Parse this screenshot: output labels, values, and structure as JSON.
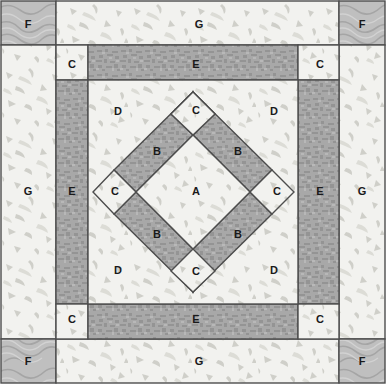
{
  "block": {
    "title": "Quilt Block Piecing Diagram",
    "width": 386,
    "height": 384,
    "outline_color": "#4d4d4d"
  },
  "fabrics": {
    "light_speckle": {
      "name": "light-speckled-fabric",
      "base_color": "#f2f2ef",
      "fleck_color": "#c9c9c4"
    },
    "dark_texture": {
      "name": "dark-textured-fabric",
      "base_color": "#a6a6a6",
      "fleck_color": "#8a8a8a"
    },
    "medium_swirl": {
      "name": "medium-swirl-fabric",
      "base_color": "#bdbdbd",
      "fleck_color": "#9e9e9e"
    }
  },
  "pieces": [
    {
      "id": "F-top-left",
      "label": "F",
      "fabric": "medium_swirl",
      "lx": 28,
      "ly": 27
    },
    {
      "id": "F-top-right",
      "label": "F",
      "fabric": "medium_swirl",
      "lx": 363,
      "ly": 27
    },
    {
      "id": "F-bottom-left",
      "label": "F",
      "fabric": "medium_swirl",
      "lx": 28,
      "ly": 364
    },
    {
      "id": "F-bottom-right",
      "label": "F",
      "fabric": "medium_swirl",
      "lx": 363,
      "ly": 364
    },
    {
      "id": "G-top",
      "label": "G",
      "fabric": "light_speckle",
      "lx": 199,
      "ly": 27
    },
    {
      "id": "G-bottom",
      "label": "G",
      "fabric": "light_speckle",
      "lx": 199,
      "ly": 364
    },
    {
      "id": "G-left",
      "label": "G",
      "fabric": "light_speckle",
      "lx": 28,
      "ly": 192
    },
    {
      "id": "G-right",
      "label": "G",
      "fabric": "light_speckle",
      "lx": 363,
      "ly": 192
    },
    {
      "id": "C-inner-top-left",
      "label": "C",
      "fabric": "light_speckle",
      "lx": 72,
      "ly": 67
    },
    {
      "id": "C-inner-top-right",
      "label": "C",
      "fabric": "light_speckle",
      "lx": 322,
      "ly": 67
    },
    {
      "id": "C-inner-bottom-left",
      "label": "C",
      "fabric": "light_speckle",
      "lx": 72,
      "ly": 320
    },
    {
      "id": "C-inner-bottom-right",
      "label": "C",
      "fabric": "light_speckle",
      "lx": 322,
      "ly": 320
    },
    {
      "id": "E-top",
      "label": "E",
      "fabric": "dark_texture",
      "lx": 196,
      "ly": 67
    },
    {
      "id": "E-bottom",
      "label": "E",
      "fabric": "dark_texture",
      "lx": 196,
      "ly": 320
    },
    {
      "id": "E-left",
      "label": "E",
      "fabric": "dark_texture",
      "lx": 72,
      "ly": 192
    },
    {
      "id": "E-right",
      "label": "E",
      "fabric": "dark_texture",
      "lx": 322,
      "ly": 192
    },
    {
      "id": "D-top-left",
      "label": "D",
      "fabric": "light_speckle",
      "lx": 118,
      "ly": 112
    },
    {
      "id": "D-top-right",
      "label": "D",
      "fabric": "light_speckle",
      "lx": 275,
      "ly": 112
    },
    {
      "id": "D-bottom-left",
      "label": "D",
      "fabric": "light_speckle",
      "lx": 118,
      "ly": 271
    },
    {
      "id": "D-bottom-right",
      "label": "D",
      "fabric": "light_speckle",
      "lx": 275,
      "ly": 271
    },
    {
      "id": "B-top-left",
      "label": "B",
      "fabric": "dark_texture",
      "lx": 156,
      "ly": 152
    },
    {
      "id": "B-top-right",
      "label": "B",
      "fabric": "dark_texture",
      "lx": 238,
      "ly": 152
    },
    {
      "id": "B-bottom-left",
      "label": "B",
      "fabric": "dark_texture",
      "lx": 156,
      "ly": 235
    },
    {
      "id": "B-bottom-right",
      "label": "B",
      "fabric": "dark_texture",
      "lx": 238,
      "ly": 235
    },
    {
      "id": "C-diamond-top",
      "label": "C",
      "fabric": "light_speckle",
      "lx": 196,
      "ly": 111
    },
    {
      "id": "C-diamond-bottom",
      "label": "C",
      "fabric": "light_speckle",
      "lx": 196,
      "ly": 274
    },
    {
      "id": "C-diamond-left",
      "label": "C",
      "fabric": "light_speckle",
      "lx": 115,
      "ly": 192
    },
    {
      "id": "C-diamond-right",
      "label": "C",
      "fabric": "light_speckle",
      "lx": 278,
      "ly": 192
    },
    {
      "id": "A-center",
      "label": "A",
      "fabric": "light_speckle",
      "lx": 196,
      "ly": 192
    }
  ]
}
